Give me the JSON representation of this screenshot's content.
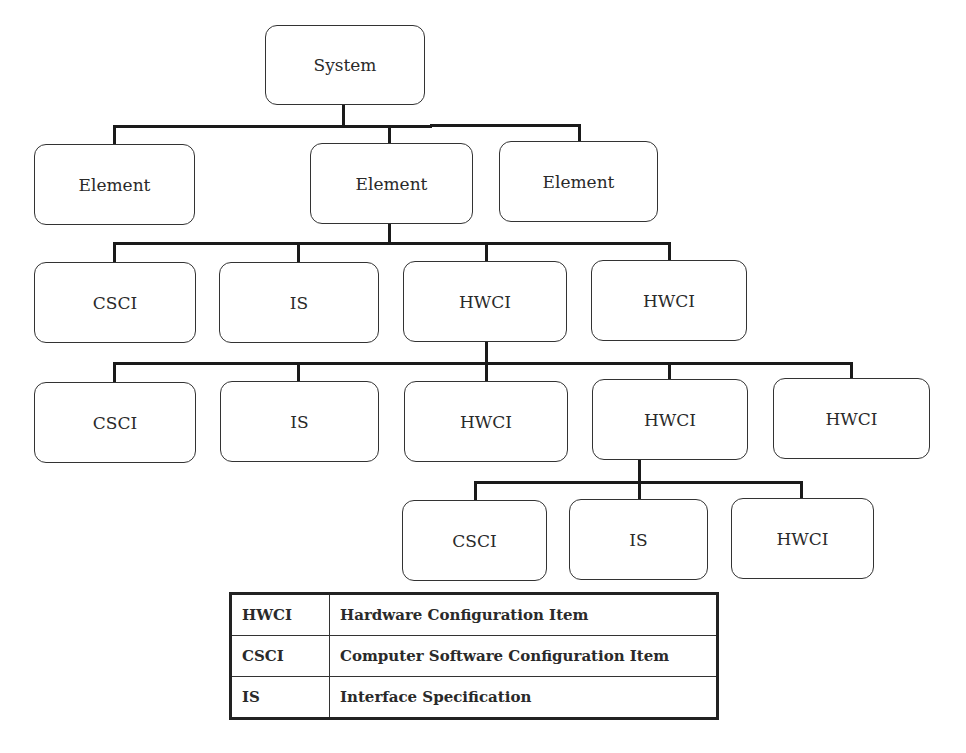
{
  "diagram": {
    "type": "hierarchy-tree",
    "nodes": {
      "system": "System",
      "level1": [
        "Element",
        "Element",
        "Element"
      ],
      "level2": [
        "CSCI",
        "IS",
        "HWCI",
        "HWCI"
      ],
      "level3": [
        "CSCI",
        "IS",
        "HWCI",
        "HWCI",
        "HWCI"
      ],
      "level4": [
        "CSCI",
        "IS",
        "HWCI"
      ]
    },
    "edges": [
      [
        "System",
        "Element (1)"
      ],
      [
        "System",
        "Element (2)"
      ],
      [
        "System",
        "Element (3)"
      ],
      [
        "Element (2)",
        "CSCI"
      ],
      [
        "Element (2)",
        "IS"
      ],
      [
        "Element (2)",
        "HWCI (A)"
      ],
      [
        "Element (2)",
        "HWCI (B)"
      ],
      [
        "HWCI (A)",
        "CSCI"
      ],
      [
        "HWCI (A)",
        "IS"
      ],
      [
        "HWCI (A)",
        "HWCI"
      ],
      [
        "HWCI (A)",
        "HWCI (C)"
      ],
      [
        "HWCI (A)",
        "HWCI"
      ],
      [
        "HWCI (C)",
        "CSCI"
      ],
      [
        "HWCI (C)",
        "IS"
      ],
      [
        "HWCI (C)",
        "HWCI"
      ]
    ]
  },
  "legend": {
    "rows": [
      {
        "abbr": "HWCI",
        "definition": "Hardware Configuration Item"
      },
      {
        "abbr": "CSCI",
        "definition": "Computer Software Configuration Item"
      },
      {
        "abbr": "IS",
        "definition": "Interface Specification"
      }
    ]
  },
  "colors": {
    "line": "#1a1a1a",
    "box_border": "#333333",
    "background": "#ffffff"
  }
}
